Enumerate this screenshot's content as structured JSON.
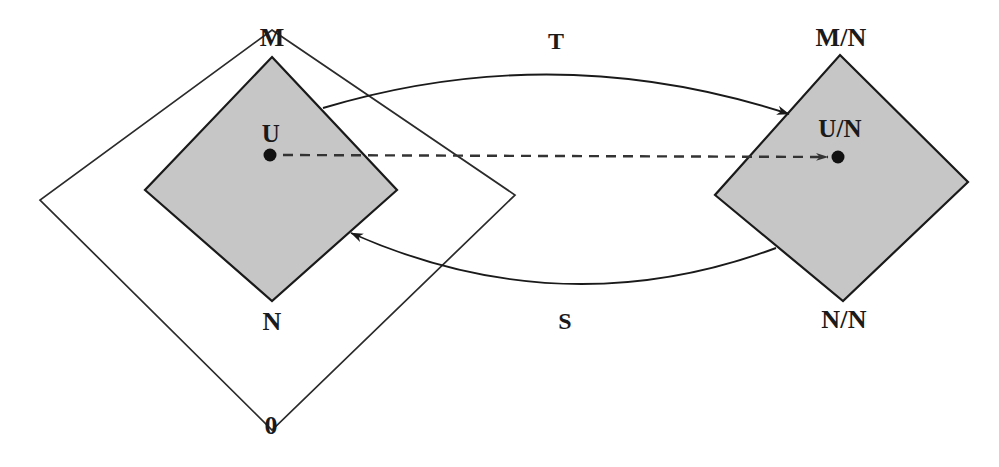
{
  "figure": {
    "type": "commutative-diagram",
    "background_color": "#ffffff",
    "shaded_fill": "#c6c6c6",
    "stroke_color": "#1a1a1a"
  },
  "labels": {
    "source_top": "M",
    "source_bottom": "N",
    "source_point": "U",
    "target_top": "M/N",
    "target_bottom": "N/N",
    "target_point": "U/N",
    "outer_bottom": "0",
    "arrow_forward": "T",
    "arrow_backward": "S"
  },
  "shapes": {
    "outer_diamond": {
      "name": "outer-diamond",
      "points": "272,30 515,195 272,430 40,200",
      "filled": false
    },
    "source_diamond": {
      "name": "source-diamond",
      "points": "272,57 397,190 272,301 145,190",
      "filled": true
    },
    "target_diamond": {
      "name": "target-diamond",
      "points": "840,55 968,182 843,301 715,195",
      "filled": true
    }
  },
  "arrows": {
    "forward": {
      "name": "arrow-T",
      "path": "M 323,108 Q 556,38 789,114",
      "style": "solid-curved",
      "label": "T",
      "label_x": 556,
      "label_y": 41
    },
    "backward": {
      "name": "arrow-S",
      "path": "M 776,248 Q 563,327 351,233",
      "style": "solid-curved",
      "label": "S",
      "label_x": 565,
      "label_y": 321
    },
    "quotient_map": {
      "name": "arrow-dashed-quotient",
      "path": "M 283,155 L 828,157",
      "style": "dashed",
      "dash_pattern": "10 7"
    }
  },
  "points": {
    "source_dot": {
      "name": "point-U",
      "x": 270,
      "y": 155,
      "r": 6
    },
    "target_dot": {
      "name": "point-U-over-N",
      "x": 838,
      "y": 157,
      "r": 6
    }
  },
  "label_positions": {
    "M": {
      "x": 272,
      "y": 38
    },
    "N": {
      "x": 272,
      "y": 322
    },
    "U": {
      "x": 271,
      "y": 133
    },
    "M_over_N": {
      "x": 841,
      "y": 38
    },
    "N_over_N": {
      "x": 844,
      "y": 320
    },
    "U_over_N": {
      "x": 840,
      "y": 128
    },
    "zero": {
      "x": 271,
      "y": 426
    }
  }
}
